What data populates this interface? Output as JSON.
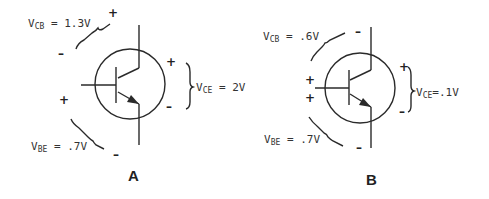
{
  "diagrams": [
    {
      "label": "A",
      "vcb": {
        "prefix": "V",
        "sub": "CB",
        "value": " = 1.3V",
        "top_sign": "+",
        "bottom_sign": "–"
      },
      "vce": {
        "prefix": "V",
        "sub": "CE",
        "value": " = 2V",
        "top_sign": "+",
        "bottom_sign": "–"
      },
      "vbe": {
        "prefix": "V",
        "sub": "BE",
        "value": " = .7V",
        "top_sign": "+",
        "bottom_sign": "–"
      }
    },
    {
      "label": "B",
      "vcb": {
        "prefix": "V",
        "sub": "CB",
        "value": " = .6V",
        "top_sign": "–",
        "bottom_sign": "+"
      },
      "vce": {
        "prefix": "V",
        "sub": "CE",
        "value": "=.1V",
        "top_sign": "+",
        "bottom_sign": "–"
      },
      "vbe": {
        "prefix": "V",
        "sub": "BE",
        "value": " = .7V",
        "top_sign": "+",
        "bottom_sign": "–"
      }
    }
  ],
  "colors": {
    "ink": "#2a2a2a",
    "background": "#ffffff"
  }
}
